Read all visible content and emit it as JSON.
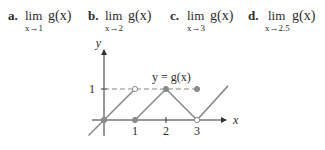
{
  "problems": [
    {
      "label": "a.",
      "lim": "lim",
      "approach": "x→1",
      "func": "g(x)"
    },
    {
      "label": "b.",
      "lim": "lim",
      "approach": "x→2",
      "func": "g(x)"
    },
    {
      "label": "c.",
      "lim": "lim",
      "approach": "x→3",
      "func": "g(x)"
    },
    {
      "label": "d.",
      "lim": "lim",
      "approach": "x→2.5",
      "func": "g(x)"
    }
  ],
  "graph": {
    "function_label": "y = g(x)",
    "x_axis_label": "x",
    "y_axis_label": "y",
    "x_ticks": [
      "1",
      "2",
      "3"
    ],
    "y_ticks": [
      "1"
    ],
    "colors": {
      "curve": "#8a8a8a",
      "axis": "#333333",
      "dashed": "#8a8a8a",
      "point": "#8a8a8a"
    },
    "segments": [
      {
        "from": [
          -0.5,
          -0.5
        ],
        "to": [
          1,
          1
        ],
        "note": "line y=x up to open circle at (1,1)"
      },
      {
        "from": [
          1,
          0
        ],
        "to": [
          2,
          1
        ],
        "note": "line up from (1,0) to (2,1)"
      },
      {
        "from": [
          2,
          1
        ],
        "to": [
          3,
          0
        ],
        "note": "line down from (2,1) to (3,0)"
      },
      {
        "from": [
          3,
          0
        ],
        "to": [
          4,
          1.1
        ],
        "note": "line up from (3,0)"
      }
    ],
    "dashed_line": {
      "y": 1,
      "from_x": 0,
      "to_x": 3
    },
    "points": [
      {
        "x": 0,
        "y": 0,
        "filled": true
      },
      {
        "x": 1,
        "y": 1,
        "filled": false
      },
      {
        "x": 1,
        "y": 0,
        "filled": true
      },
      {
        "x": 2,
        "y": 1,
        "filled": true
      },
      {
        "x": 3,
        "y": 0,
        "filled": false
      },
      {
        "x": 3,
        "y": 1,
        "filled": true
      }
    ]
  }
}
